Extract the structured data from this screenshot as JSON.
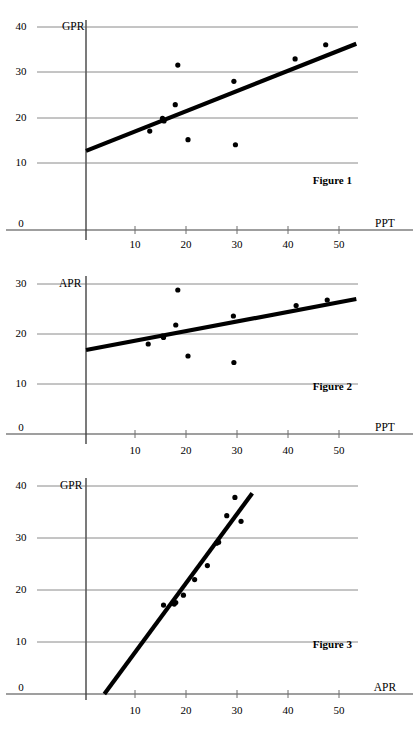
{
  "page": {
    "background": "#ffffff",
    "ink": "#000000",
    "gridline_color": "#8a8a8a",
    "axis_color": "#5a5a5a",
    "fit_line_color": "#000000",
    "point_color": "#000000"
  },
  "figures": [
    {
      "id": "figure-1",
      "caption": "Figure 1",
      "y_axis_name": "GPR",
      "x_axis_name": "PPT",
      "y_ticks": [
        "40",
        "30",
        "20",
        "10",
        "0"
      ],
      "x_ticks": [
        "10",
        "20",
        "30",
        "40",
        "50"
      ]
    },
    {
      "id": "figure-2",
      "caption": "Figure 2",
      "y_axis_name": "APR",
      "x_axis_name": "PPT",
      "y_ticks": [
        "30",
        "20",
        "10",
        "0"
      ],
      "x_ticks": [
        "10",
        "20",
        "30",
        "40",
        "50"
      ]
    },
    {
      "id": "figure-3",
      "caption": "Figure 3",
      "y_axis_name": "GPR",
      "x_axis_name": "APR",
      "y_ticks": [
        "40",
        "30",
        "20",
        "10",
        "0"
      ],
      "x_ticks": [
        "10",
        "20",
        "30",
        "40",
        "50"
      ]
    }
  ],
  "chart_data": [
    {
      "type": "scatter",
      "title": "Figure 1",
      "xlabel": "PPT",
      "ylabel": "GPR",
      "xlim": [
        0,
        57
      ],
      "ylim": [
        0,
        41
      ],
      "xticks": [
        10,
        20,
        30,
        40,
        50
      ],
      "yticks": [
        0,
        10,
        20,
        30,
        40
      ],
      "grid": true,
      "legend": "none",
      "points": [
        {
          "x": 12.5,
          "y": 19.5
        },
        {
          "x": 15.0,
          "y": 22.0
        },
        {
          "x": 15.3,
          "y": 21.5
        },
        {
          "x": 17.5,
          "y": 24.7
        },
        {
          "x": 18.0,
          "y": 32.5
        },
        {
          "x": 20.0,
          "y": 17.8
        },
        {
          "x": 29.0,
          "y": 29.3
        },
        {
          "x": 29.3,
          "y": 16.8
        },
        {
          "x": 41.0,
          "y": 33.7
        },
        {
          "x": 47.0,
          "y": 36.5
        }
      ],
      "fit_line": {
        "x1": 0,
        "y1": 15.6,
        "x2": 53,
        "y2": 36.7
      }
    },
    {
      "type": "scatter",
      "title": "Figure 2",
      "xlabel": "PPT",
      "ylabel": "APR",
      "xlim": [
        0,
        57
      ],
      "ylim": [
        0,
        31
      ],
      "xticks": [
        10,
        20,
        30,
        40,
        50
      ],
      "yticks": [
        0,
        10,
        20,
        30
      ],
      "grid": true,
      "legend": "none",
      "points": [
        {
          "x": 12.2,
          "y": 18.0
        },
        {
          "x": 15.0,
          "y": 19.6
        },
        {
          "x": 15.2,
          "y": 19.3
        },
        {
          "x": 17.6,
          "y": 21.8
        },
        {
          "x": 18.0,
          "y": 28.8
        },
        {
          "x": 20.0,
          "y": 15.6
        },
        {
          "x": 28.9,
          "y": 23.6
        },
        {
          "x": 29.0,
          "y": 14.3
        },
        {
          "x": 41.2,
          "y": 25.7
        },
        {
          "x": 47.3,
          "y": 26.8
        }
      ],
      "fit_line": {
        "x1": 0,
        "y1": 16.8,
        "x2": 53,
        "y2": 27.0
      }
    },
    {
      "type": "scatter",
      "title": "Figure 3",
      "xlabel": "APR",
      "ylabel": "GPR",
      "xlim": [
        0,
        57
      ],
      "ylim": [
        0,
        41
      ],
      "xticks": [
        10,
        20,
        30,
        40,
        50
      ],
      "yticks": [
        0,
        10,
        20,
        30,
        40
      ],
      "grid": true,
      "legend": "none",
      "points": [
        {
          "x": 15.2,
          "y": 17.1
        },
        {
          "x": 17.3,
          "y": 17.3
        },
        {
          "x": 17.6,
          "y": 17.6
        },
        {
          "x": 19.1,
          "y": 19.0
        },
        {
          "x": 21.3,
          "y": 22.0
        },
        {
          "x": 23.8,
          "y": 24.7
        },
        {
          "x": 25.6,
          "y": 29.0
        },
        {
          "x": 26.0,
          "y": 29.2
        },
        {
          "x": 27.6,
          "y": 34.3
        },
        {
          "x": 29.2,
          "y": 37.8
        },
        {
          "x": 30.4,
          "y": 33.2
        }
      ],
      "fit_line": {
        "x1": 3.6,
        "y1": 0.0,
        "x2": 32.6,
        "y2": 38.6
      }
    }
  ]
}
